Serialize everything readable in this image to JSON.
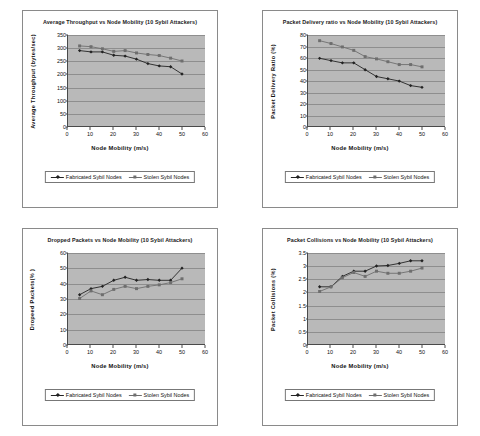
{
  "page": {
    "background": "#ffffff",
    "series_colors": {
      "fabricated": "#222222",
      "stolen": "#6e6e6e"
    },
    "plot_background": "#b9b9b9",
    "gridline_color": "#8e8e8e"
  },
  "legend": {
    "fabricated_label": "Fabricated Sybil Nodes",
    "stolen_label": "Stolen Sybil Nodes"
  },
  "chart_data": [
    {
      "id": "average-throughput",
      "type": "line",
      "title": "Average Throughput vs Node Mobility (10 Sybil Attackers)",
      "xlabel": "Node Mobility (m/s)",
      "ylabel": "Average Throughput (bytes/sec)",
      "ylabel_line1": "Average Throughput",
      "ylabel_line2": "(bytes/sec)",
      "xlim": [
        0,
        60
      ],
      "ylim": [
        0,
        350
      ],
      "xticks": [
        0,
        10,
        20,
        30,
        40,
        50,
        60
      ],
      "yticks": [
        0,
        50,
        100,
        150,
        200,
        250,
        300,
        350
      ],
      "grid": true,
      "legend_position": "bottom",
      "x": [
        5,
        10,
        15,
        20,
        25,
        30,
        35,
        40,
        45,
        50
      ],
      "series": [
        {
          "name": "Fabricated Sybil Nodes",
          "marker": "diamond",
          "color": "#222222",
          "values": [
            290,
            285,
            285,
            272,
            269,
            257,
            240,
            231,
            228,
            200
          ]
        },
        {
          "name": "Stolen Sybil Nodes",
          "marker": "square",
          "color": "#6e6e6e",
          "values": [
            308,
            305,
            297,
            287,
            290,
            281,
            275,
            271,
            261,
            250
          ]
        }
      ]
    },
    {
      "id": "packet-delivery-ratio",
      "type": "line",
      "title": "Packet Delivery ratio vs Node Mobility (10 Sybil Attackers)",
      "xlabel": "Node Mobility (m/s)",
      "ylabel": "Packet Delivery Ratio (%)",
      "ylabel_line1": "Packet Delivery Ratio (%)",
      "ylabel_line2": "",
      "xlim": [
        0,
        60
      ],
      "ylim": [
        0,
        80
      ],
      "xticks": [
        0,
        10,
        20,
        30,
        40,
        50,
        60
      ],
      "yticks": [
        0,
        10,
        20,
        30,
        40,
        50,
        60,
        70,
        80
      ],
      "grid": true,
      "legend_position": "bottom",
      "x": [
        5,
        10,
        15,
        20,
        25,
        30,
        35,
        40,
        45,
        50
      ],
      "series": [
        {
          "name": "Fabricated Sybil Nodes",
          "marker": "diamond",
          "color": "#222222",
          "values": [
            59.5,
            57.5,
            55.5,
            55.5,
            49.5,
            43.5,
            41.5,
            39.5,
            35.5,
            34
          ]
        },
        {
          "name": "Stolen Sybil Nodes",
          "marker": "square",
          "color": "#6e6e6e",
          "values": [
            75,
            72.5,
            69.5,
            66.5,
            61,
            59,
            56.5,
            54,
            54,
            52
          ]
        }
      ]
    },
    {
      "id": "dropped-packets",
      "type": "line",
      "title": "Dropped Packets vs Node Mobility (10 Sybil Attackers)",
      "xlabel": "Node Mobility (m/s)",
      "ylabel": "Dropeed Packets(% )",
      "ylabel_line1": "Dropeed Packets(% )",
      "ylabel_line2": "",
      "xlim": [
        0,
        60
      ],
      "ylim": [
        0,
        60
      ],
      "xticks": [
        0,
        10,
        20,
        30,
        40,
        50,
        60
      ],
      "yticks": [
        0,
        10,
        20,
        30,
        40,
        50,
        60
      ],
      "grid": true,
      "legend_position": "bottom",
      "x": [
        5,
        10,
        15,
        20,
        25,
        30,
        35,
        40,
        45,
        50
      ],
      "series": [
        {
          "name": "Fabricated Sybil Nodes",
          "marker": "diamond",
          "color": "#222222",
          "values": [
            32.5,
            36.5,
            38,
            42,
            44,
            42,
            42.5,
            42,
            42,
            50
          ]
        },
        {
          "name": "Stolen Sybil Nodes",
          "marker": "square",
          "color": "#6e6e6e",
          "values": [
            30,
            35,
            32.5,
            36,
            38,
            36.5,
            38,
            39,
            40.5,
            43
          ]
        }
      ]
    },
    {
      "id": "packet-collisions",
      "type": "line",
      "title": "Packet Collisions vs Node Mobility (10 Sybil Attackers)",
      "xlabel": "Node Mobility (m/s)",
      "ylabel": "Packet Collisions (%)",
      "ylabel_line1": "Packet Collisions (%)",
      "ylabel_line2": "",
      "xlim": [
        0,
        60
      ],
      "ylim": [
        0,
        3.5
      ],
      "xticks": [
        0,
        10,
        20,
        30,
        40,
        50,
        60
      ],
      "yticks": [
        0,
        0.5,
        1,
        1.5,
        2,
        2.5,
        3,
        3.5
      ],
      "grid": true,
      "legend_position": "bottom",
      "x": [
        5,
        10,
        15,
        20,
        25,
        30,
        35,
        40,
        45,
        50
      ],
      "series": [
        {
          "name": "Fabricated Sybil Nodes",
          "marker": "diamond",
          "color": "#222222",
          "values": [
            2.2,
            2.2,
            2.6,
            2.8,
            2.8,
            3.0,
            3.02,
            3.1,
            3.2,
            3.2
          ]
        },
        {
          "name": "Stolen Sybil Nodes",
          "marker": "square",
          "color": "#6e6e6e",
          "values": [
            2.02,
            2.2,
            2.55,
            2.75,
            2.6,
            2.8,
            2.72,
            2.72,
            2.8,
            2.92
          ]
        }
      ]
    }
  ]
}
